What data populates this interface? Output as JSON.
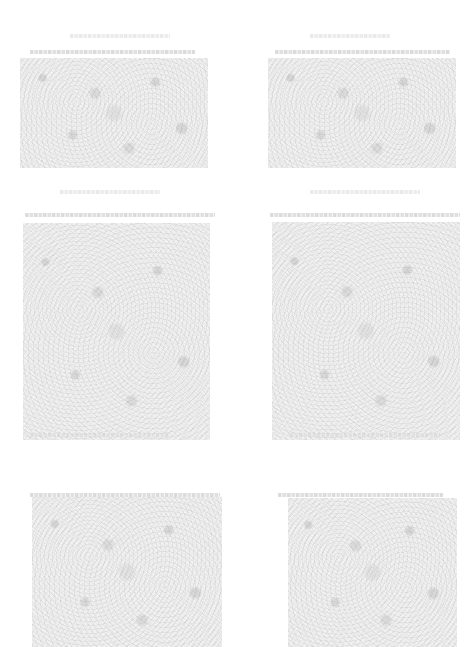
{
  "page": {
    "background_color": "#ffffff",
    "texture_color": "#f1f1f1",
    "caption_color": "#cfcfcf"
  },
  "figures": [
    {
      "id": "top-left",
      "caption": ""
    },
    {
      "id": "top-right",
      "caption": ""
    },
    {
      "id": "middle-left",
      "caption": ""
    },
    {
      "id": "middle-right",
      "caption": ""
    },
    {
      "id": "bottom-left",
      "caption": ""
    },
    {
      "id": "bottom-right",
      "caption": ""
    }
  ],
  "captions": {
    "row1_left": "",
    "row1_right": "",
    "row2_left": "",
    "row2_right": "",
    "row3_left": "",
    "row3_right": "",
    "row4_left": "",
    "row4_right": ""
  }
}
